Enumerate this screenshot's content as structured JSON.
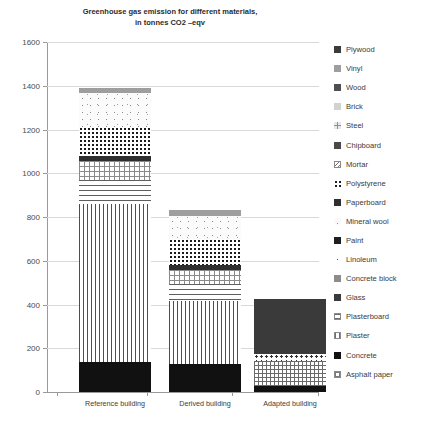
{
  "chart_data": {
    "type": "bar",
    "stacked": true,
    "title": "Greenhouse gas emission for different materials, in tonnes CO2 –eqv",
    "title_line1": "Greenhouse gas emission for different materials,",
    "title_line2": "in tonnes CO2 –eqv",
    "xlabel": "",
    "ylabel": "",
    "categories": [
      "Reference building",
      "Derived building",
      "Adapted building"
    ],
    "ylim": [
      0,
      1600
    ],
    "yticks": [
      0,
      200,
      400,
      600,
      800,
      1000,
      1200,
      1400,
      1600
    ],
    "ytick_labels": [
      "0",
      "200",
      "400",
      "600",
      "800",
      "1000",
      "1200",
      "1400",
      "1600"
    ],
    "grid": true,
    "grid_axis": "y",
    "legend_position": "right",
    "totals": [
      1390,
      830,
      425
    ],
    "series": [
      {
        "name": "Plywood",
        "key": "plywood",
        "color": "#3b3b3b",
        "pattern": "solid-dark",
        "values": [
          0,
          0,
          0
        ]
      },
      {
        "name": "Vinyl",
        "key": "vinyl",
        "color": "#9e9e9e",
        "pattern": "solid-mid",
        "values": [
          25,
          25,
          0
        ]
      },
      {
        "name": "Wood",
        "key": "wood",
        "color": "#4f4f4f",
        "pattern": "solid-dark",
        "values": [
          0,
          0,
          0
        ]
      },
      {
        "name": "Brick",
        "key": "brick",
        "color": "#d2d2d2",
        "pattern": "solid-light",
        "values": [
          0,
          0,
          0
        ]
      },
      {
        "name": "Steel",
        "key": "steel",
        "color": "#e8e8e8",
        "pattern": "fine-grid",
        "values": [
          0,
          0,
          0
        ]
      },
      {
        "name": "Chipboard",
        "key": "chipboard",
        "color": "#4a4a4a",
        "pattern": "solid-dark",
        "values": [
          0,
          0,
          0
        ]
      },
      {
        "name": "Mortar",
        "key": "mortar",
        "color": "#ffffff",
        "pattern": "diagonal",
        "values": [
          0,
          0,
          0
        ]
      },
      {
        "name": "Polystyrene",
        "key": "polystyrene",
        "color": "#ffffff",
        "pattern": "dots",
        "values": [
          130,
          120,
          0
        ]
      },
      {
        "name": "Paperboard",
        "key": "paperboard",
        "color": "#2f2f2f",
        "pattern": "solid-dark",
        "values": [
          22,
          22,
          0
        ]
      },
      {
        "name": "Mineral wool",
        "key": "mineralwool",
        "color": "#fbfbfb",
        "pattern": "cloud",
        "values": [
          155,
          105,
          0
        ]
      },
      {
        "name": "Paint",
        "key": "paint",
        "color": "#1e1e1e",
        "pattern": "solid-black",
        "values": [
          0,
          0,
          0
        ]
      },
      {
        "name": "Linoleum",
        "key": "linoleum",
        "color": "#ffffff",
        "pattern": "sparse-dots",
        "values": [
          0,
          0,
          32
        ]
      },
      {
        "name": "Concrete block",
        "key": "concreteblock",
        "color": "#8c8c8c",
        "pattern": "solid-mid",
        "values": [
          0,
          0,
          0
        ]
      },
      {
        "name": "Glass",
        "key": "glass",
        "color": "#3a3a3a",
        "pattern": "solid-dark",
        "values": [
          0,
          0,
          250
        ]
      },
      {
        "name": "Plasterboard",
        "key": "plasterboard",
        "color": "#ffffff",
        "pattern": "horizontal",
        "values": [
          110,
          75,
          0
        ]
      },
      {
        "name": "Plaster",
        "key": "plaster",
        "color": "#ffffff",
        "pattern": "vertical",
        "values": [
          810,
          290,
          0
        ]
      },
      {
        "name": "Concrete",
        "key": "concrete",
        "color": "#111111",
        "pattern": "solid-black",
        "values": [
          138,
          128,
          28
        ]
      },
      {
        "name": "Asphalt paper",
        "key": "asphaltpaper",
        "color": "#ffffff",
        "pattern": "grid",
        "values": [
          0,
          65,
          115
        ]
      }
    ],
    "bars": [
      {
        "category": "Reference building",
        "total": 1390,
        "segments": [
          {
            "name": "Vinyl",
            "key": "vinyl",
            "value": 25
          },
          {
            "name": "Mineral wool",
            "key": "mineralwool",
            "value": 155
          },
          {
            "name": "Polystyrene",
            "key": "polystyrene",
            "value": 130
          },
          {
            "name": "Paperboard",
            "key": "paperboard",
            "value": 22
          },
          {
            "name": "Mortar",
            "key": "mortar",
            "value": 90
          },
          {
            "name": "Plasterboard",
            "key": "plasterboard",
            "value": 110
          },
          {
            "name": "Plaster",
            "key": "plaster",
            "value": 720
          },
          {
            "name": "Concrete",
            "key": "concrete",
            "value": 138
          }
        ]
      },
      {
        "category": "Derived building",
        "total": 830,
        "segments": [
          {
            "name": "Vinyl",
            "key": "vinyl",
            "value": 25
          },
          {
            "name": "Mineral wool",
            "key": "mineralwool",
            "value": 105
          },
          {
            "name": "Polystyrene",
            "key": "polystyrene",
            "value": 120
          },
          {
            "name": "Paperboard",
            "key": "paperboard",
            "value": 22
          },
          {
            "name": "Mortar",
            "key": "mortar",
            "value": 65
          },
          {
            "name": "Plasterboard",
            "key": "plasterboard",
            "value": 75
          },
          {
            "name": "Plaster",
            "key": "plaster",
            "value": 290
          },
          {
            "name": "Concrete",
            "key": "concrete",
            "value": 128
          }
        ]
      },
      {
        "category": "Adapted building",
        "total": 425,
        "segments": [
          {
            "name": "Glass",
            "key": "glass",
            "value": 250
          },
          {
            "name": "Linoleum",
            "key": "linoleum",
            "value": 32
          },
          {
            "name": "Asphalt paper",
            "key": "asphaltpaper",
            "value": 115
          },
          {
            "name": "Concrete",
            "key": "concrete",
            "value": 28
          }
        ]
      }
    ]
  },
  "legend": {
    "items": [
      {
        "label": "Plywood",
        "key": "plywood"
      },
      {
        "label": "Vinyl",
        "key": "vinyl"
      },
      {
        "label": "Wood",
        "key": "wood"
      },
      {
        "label": "Brick",
        "key": "brick"
      },
      {
        "label": "Steel",
        "key": "steel"
      },
      {
        "label": "Chipboard",
        "key": "chipboard"
      },
      {
        "label": "Mortar",
        "key": "mortar"
      },
      {
        "label": "Polystyrene",
        "key": "polystyrene"
      },
      {
        "label": "Paperboard",
        "key": "paperboard"
      },
      {
        "label": "Mineral wool",
        "key": "mineralwool"
      },
      {
        "label": "Paint",
        "key": "paint"
      },
      {
        "label": "Linoleum",
        "key": "linoleum"
      },
      {
        "label": "Concrete block",
        "key": "concreteblock"
      },
      {
        "label": "Glass",
        "key": "glass"
      },
      {
        "label": "Plasterboard",
        "key": "plasterboard"
      },
      {
        "label": "Plaster",
        "key": "plaster"
      },
      {
        "label": "Concrete",
        "key": "concrete"
      },
      {
        "label": "Asphalt paper",
        "key": "asphaltpaper"
      }
    ]
  }
}
